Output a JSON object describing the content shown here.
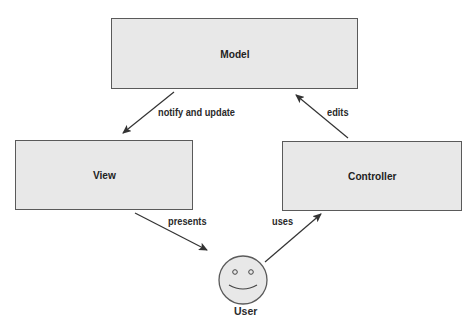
{
  "diagram": {
    "nodes": {
      "model": {
        "label": "Model"
      },
      "view": {
        "label": "View"
      },
      "controller": {
        "label": "Controller"
      },
      "user": {
        "label": "User"
      }
    },
    "edges": [
      {
        "from": "model",
        "to": "view",
        "label": "notify and update"
      },
      {
        "from": "controller",
        "to": "model",
        "label": "edits"
      },
      {
        "from": "view",
        "to": "user",
        "label": "presents"
      },
      {
        "from": "user",
        "to": "controller",
        "label": "uses"
      }
    ]
  },
  "colors": {
    "box_fill": "#e8e8e8",
    "box_border": "#5a5a5a",
    "arrow": "#333333"
  }
}
